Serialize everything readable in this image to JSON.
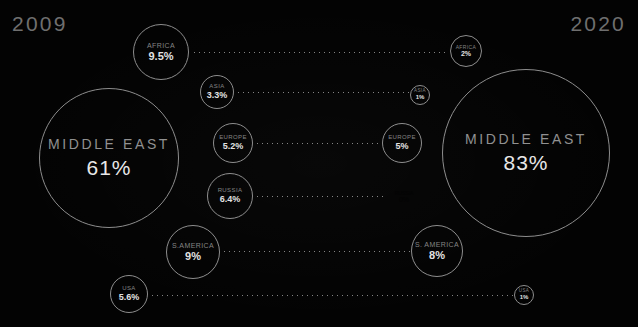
{
  "chart_data": {
    "type": "bubble",
    "title": "",
    "xlabel": "",
    "ylabel": "",
    "legend_position": "none",
    "grid": false,
    "unit": "%",
    "periods": [
      {
        "key": "left",
        "label": "2009"
      },
      {
        "key": "right",
        "label": "2020"
      }
    ],
    "categories": [
      "AFRICA",
      "ASIA",
      "EUROPE",
      "RUSSIA",
      "S. AMERICA",
      "USA",
      "MIDDLE EAST"
    ],
    "series": [
      {
        "name": "2009",
        "values": [
          9.5,
          3.3,
          5.2,
          6.4,
          9,
          5.6,
          61
        ]
      },
      {
        "name": "2020",
        "values": [
          2,
          1,
          5,
          0,
          8,
          1,
          83
        ]
      }
    ],
    "nodes_2009": [
      {
        "name": "africa-2009",
        "label": "AFRICA",
        "value": "9.5%",
        "cx": 161,
        "cy": 52,
        "r": 28,
        "tier": "tier-lg"
      },
      {
        "name": "asia-2009",
        "label": "ASIA",
        "value": "3.3%",
        "cx": 217,
        "cy": 92,
        "r": 17,
        "tier": "tier-md"
      },
      {
        "name": "europe-2009",
        "label": "EUROPE",
        "value": "5.2%",
        "cx": 233,
        "cy": 143,
        "r": 20,
        "tier": "tier-md"
      },
      {
        "name": "russia-2009",
        "label": "RUSSIA",
        "value": "6.4%",
        "cx": 230,
        "cy": 196,
        "r": 23,
        "tier": "tier-md"
      },
      {
        "name": "s-america-2009",
        "label": "S.AMERICA",
        "value": "9%",
        "cx": 193,
        "cy": 252,
        "r": 27,
        "tier": "tier-lg"
      },
      {
        "name": "usa-2009",
        "label": "USA",
        "value": "5.6%",
        "cx": 129,
        "cy": 294,
        "r": 19,
        "tier": "tier-md"
      },
      {
        "name": "middle-east-2009",
        "label": "MIDDLE EAST",
        "value": "61%",
        "cx": 109,
        "cy": 158,
        "r": 70,
        "tier": "tier-huge"
      }
    ],
    "nodes_2020": [
      {
        "name": "africa-2020",
        "label": "AFRICA",
        "value": "2%",
        "cx": 466,
        "cy": 51,
        "r": 16,
        "tier": "tier-sm"
      },
      {
        "name": "asia-2020",
        "label": "ASIA",
        "value": "1%",
        "cx": 420,
        "cy": 95,
        "r": 10,
        "tier": "tier-xs"
      },
      {
        "name": "europe-2020",
        "label": "EUROPE",
        "value": "5%",
        "cx": 402,
        "cy": 143,
        "r": 20,
        "tier": "tier-md"
      },
      {
        "name": "russia-2020",
        "label": "RUSSIA",
        "value": "0%",
        "cx": 404,
        "cy": 196,
        "r": 0,
        "tier": "tier-sm"
      },
      {
        "name": "s-america-2020",
        "label": "S. AMERICA",
        "value": "8%",
        "cx": 437,
        "cy": 251,
        "r": 26,
        "tier": "tier-lg"
      },
      {
        "name": "usa-2020",
        "label": "USA",
        "value": "1%",
        "cx": 524,
        "cy": 295,
        "r": 10,
        "tier": "tier-xs"
      },
      {
        "name": "middle-east-2020",
        "label": "MIDDLE EAST",
        "value": "83%",
        "cx": 526,
        "cy": 153,
        "r": 84,
        "tier": "tier-huge"
      }
    ],
    "connectors": [
      {
        "name": "connector-africa",
        "x1": 192,
        "x2": 449,
        "y": 52
      },
      {
        "name": "connector-asia",
        "x1": 236,
        "x2": 409,
        "y": 92
      },
      {
        "name": "connector-europe",
        "x1": 255,
        "x2": 381,
        "y": 143
      },
      {
        "name": "connector-russia",
        "x1": 255,
        "x2": 385,
        "y": 196
      },
      {
        "name": "connector-s-america",
        "x1": 222,
        "x2": 410,
        "y": 251
      },
      {
        "name": "connector-usa",
        "x1": 150,
        "x2": 513,
        "y": 295
      }
    ]
  },
  "header": {
    "year_left": "2009",
    "year_right": "2020"
  },
  "colors": {
    "background": "#030303",
    "stroke": "#8d8d8d",
    "label": "#848484",
    "value": "#e2e2e2",
    "year": "#6f6f6f"
  }
}
